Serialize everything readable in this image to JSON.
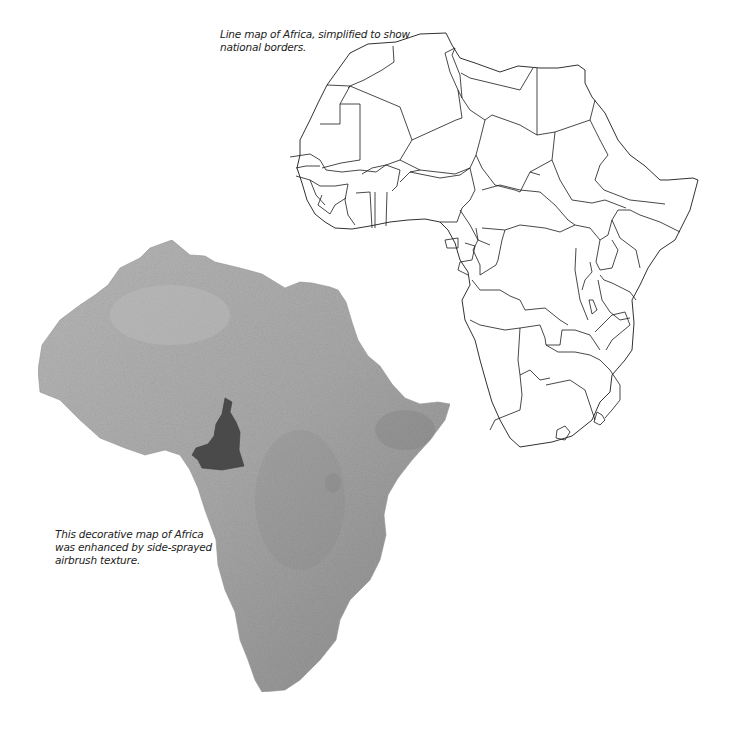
{
  "captions": {
    "line_map": "Line map of Africa, simplified to show national borders.",
    "relief_map": "This decorative map of Africa was enhanced by side-sprayed airbrush texture."
  },
  "maps": {
    "line_map": {
      "title": "Line map of Africa",
      "style": "outline",
      "stroke_color": "#1a1a1a",
      "fill_color": "#ffffff"
    },
    "relief_map": {
      "title": "Decorative relief map of Africa",
      "style": "airbrush-texture",
      "base_color": "#a8a8a8",
      "highlighted_country": "Cameroon",
      "highlight_color": "#4a4a4a"
    }
  }
}
